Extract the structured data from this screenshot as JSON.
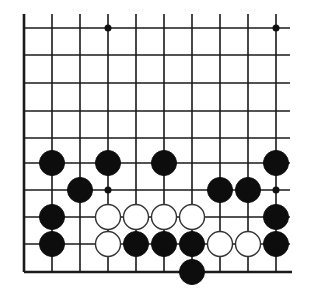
{
  "diagram": {
    "type": "go-board-fragment",
    "columns_x": [
      24,
      52,
      80,
      108,
      136,
      164,
      192,
      220,
      248,
      276
    ],
    "rows_y": [
      28,
      55,
      83,
      111,
      138,
      163,
      190,
      217,
      244,
      272
    ],
    "left_edge": true,
    "bottom_edge": true,
    "line_color": "#1a1a1a",
    "star_points": [
      [
        3,
        0
      ],
      [
        9,
        0
      ],
      [
        3,
        6
      ],
      [
        9,
        6
      ]
    ],
    "stones": [
      {
        "color": "black",
        "col": 1,
        "row": 5
      },
      {
        "color": "black",
        "col": 3,
        "row": 5
      },
      {
        "color": "black",
        "col": 5,
        "row": 5
      },
      {
        "color": "black",
        "col": 9,
        "row": 5
      },
      {
        "color": "black",
        "col": 2,
        "row": 6
      },
      {
        "color": "black",
        "col": 7,
        "row": 6
      },
      {
        "color": "black",
        "col": 8,
        "row": 6
      },
      {
        "color": "black",
        "col": 1,
        "row": 7
      },
      {
        "color": "white",
        "col": 3,
        "row": 7
      },
      {
        "color": "white",
        "col": 4,
        "row": 7
      },
      {
        "color": "white",
        "col": 5,
        "row": 7
      },
      {
        "color": "white",
        "col": 6,
        "row": 7
      },
      {
        "color": "black",
        "col": 9,
        "row": 7
      },
      {
        "color": "black",
        "col": 1,
        "row": 8
      },
      {
        "color": "white",
        "col": 3,
        "row": 8
      },
      {
        "color": "black",
        "col": 4,
        "row": 8
      },
      {
        "color": "black",
        "col": 5,
        "row": 8
      },
      {
        "color": "black",
        "col": 6,
        "row": 8
      },
      {
        "color": "white",
        "col": 7,
        "row": 8
      },
      {
        "color": "white",
        "col": 8,
        "row": 8
      },
      {
        "color": "black",
        "col": 9,
        "row": 8
      },
      {
        "color": "black",
        "col": 6,
        "row": 9
      }
    ]
  }
}
